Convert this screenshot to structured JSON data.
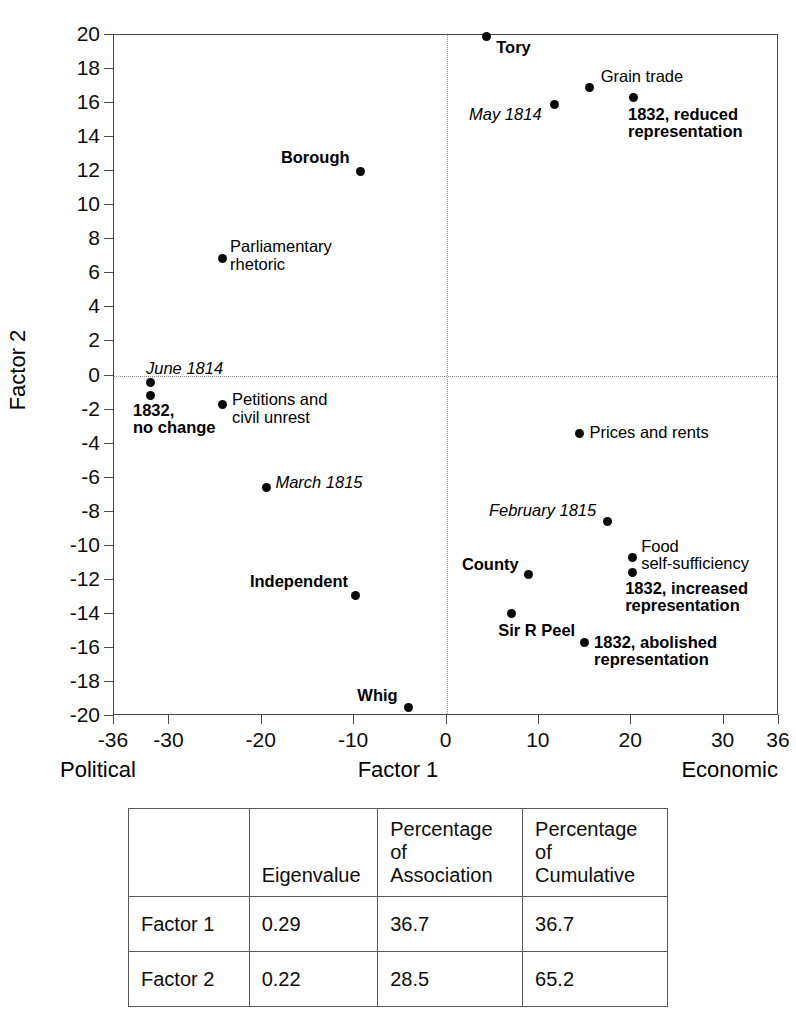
{
  "chart_data": {
    "type": "scatter",
    "title": "",
    "xlabel": "Factor 1",
    "ylabel": "Factor 2",
    "xlim": [
      -36,
      36
    ],
    "ylim": [
      -20,
      20
    ],
    "x_pole_left": "Political",
    "x_pole_right": "Economic",
    "grid": false,
    "zero_lines": true,
    "legend": "none",
    "xticks": [
      "-36",
      "-30",
      "-20",
      "-10",
      "0",
      "10",
      "20",
      "30",
      "36"
    ],
    "xtick_values": [
      -36,
      -30,
      -20,
      -10,
      0,
      10,
      20,
      30,
      36
    ],
    "yticks": [
      "20",
      "18",
      "16",
      "14",
      "12",
      "10",
      "8",
      "6",
      "4",
      "2",
      "0",
      "-2",
      "-4",
      "-6",
      "-8",
      "-10",
      "-12",
      "-14",
      "-16",
      "-18",
      "-20"
    ],
    "ytick_values": [
      20,
      18,
      16,
      14,
      12,
      10,
      8,
      6,
      4,
      2,
      0,
      -2,
      -4,
      -6,
      -8,
      -10,
      -12,
      -14,
      -16,
      -18,
      -20
    ],
    "marker_color": "#0a0a0a",
    "points": [
      {
        "label": "Tory",
        "x": 4.3,
        "y": 19.9,
        "style": "bold",
        "align": "left",
        "lx": 10,
        "ly": 2
      },
      {
        "label": "Grain trade",
        "x": 15.5,
        "y": 16.9,
        "style": "plain",
        "align": "left",
        "lx": 11,
        "ly": -20
      },
      {
        "label": "May 1814",
        "x": 11.7,
        "y": 15.9,
        "style": "italic",
        "align": "right",
        "lx": -11,
        "ly": 1
      },
      {
        "label": "1832, reduced\nrepresentation",
        "x": 20.3,
        "y": 16.3,
        "style": "bold",
        "align": "left",
        "lx": -6,
        "ly": 8
      },
      {
        "label": "Borough",
        "x": -9.3,
        "y": 12.0,
        "style": "bold",
        "align": "right",
        "lx": -9,
        "ly": -22
      },
      {
        "label": "Parliamentary\nrhetoric",
        "x": -24.3,
        "y": 6.9,
        "style": "plain",
        "align": "left",
        "lx": 8,
        "ly": -20
      },
      {
        "label": "June 1814",
        "x": -32.1,
        "y": -0.4,
        "style": "italic",
        "align": "left",
        "lx": -4,
        "ly": -22
      },
      {
        "label": "1832,\nno change",
        "x": -32.1,
        "y": -1.2,
        "style": "bold",
        "align": "left",
        "lx": -17,
        "ly": 6
      },
      {
        "label": "Petitions and\ncivil unrest",
        "x": -24.2,
        "y": -1.7,
        "style": "plain",
        "align": "left",
        "lx": 9,
        "ly": -13
      },
      {
        "label": "March 1815",
        "x": -19.5,
        "y": -6.6,
        "style": "italic",
        "align": "left",
        "lx": 9,
        "ly": -14
      },
      {
        "label": "Independent",
        "x": -9.8,
        "y": -12.9,
        "style": "bold",
        "align": "right",
        "lx": -6,
        "ly": -22
      },
      {
        "label": "Whig",
        "x": -4.1,
        "y": -19.5,
        "style": "bold",
        "align": "right",
        "lx": -9,
        "ly": -20
      },
      {
        "label": "Prices and rents",
        "x": 14.4,
        "y": -3.4,
        "style": "plain",
        "align": "left",
        "lx": 10,
        "ly": -9
      },
      {
        "label": "February 1815",
        "x": 17.4,
        "y": -8.6,
        "style": "italic",
        "align": "right",
        "lx": -9,
        "ly": -20
      },
      {
        "label": "County",
        "x": 8.9,
        "y": -11.7,
        "style": "bold",
        "align": "right",
        "lx": -8,
        "ly": -19
      },
      {
        "label": "Food\nself-sufficiency",
        "x": 20.1,
        "y": -10.7,
        "style": "plain",
        "align": "left",
        "lx": 9,
        "ly": -20
      },
      {
        "label": "1832, increased\nrepresentation",
        "x": 20.1,
        "y": -11.6,
        "style": "bold",
        "align": "left",
        "lx": -7,
        "ly": 7
      },
      {
        "label": "Sir R Peel",
        "x": 7.0,
        "y": -14.0,
        "style": "bold",
        "align": "left",
        "lx": -13,
        "ly": 8
      },
      {
        "label": "1832, abolished\nrepresentation",
        "x": 14.9,
        "y": -15.7,
        "style": "bold",
        "align": "left",
        "lx": 10,
        "ly": -9
      }
    ]
  },
  "table": {
    "headers": [
      "",
      "Eigenvalue",
      "Percentage of Association",
      "Percentage of Cumulative"
    ],
    "headers_split": [
      {
        "l1": "",
        "l2": ""
      },
      {
        "l1": "Eigenvalue",
        "l2": ""
      },
      {
        "l1": "Percentage of",
        "l2": "Association"
      },
      {
        "l1": "Percentage of",
        "l2": "Cumulative"
      }
    ],
    "rows": [
      {
        "name": "Factor 1",
        "eigenvalue": "0.29",
        "pct_association": "36.7",
        "pct_cumulative": "36.7"
      },
      {
        "name": "Factor 2",
        "eigenvalue": "0.22",
        "pct_association": "28.5",
        "pct_cumulative": "65.2"
      }
    ]
  }
}
